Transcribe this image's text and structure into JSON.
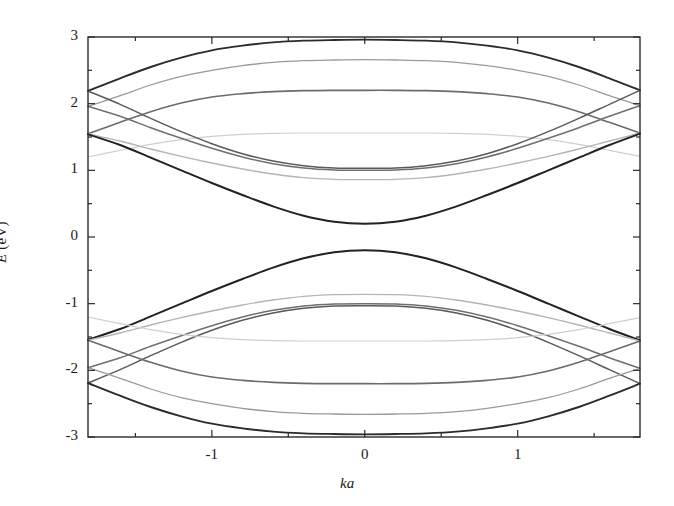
{
  "figure": {
    "kind": "band-structure-plot",
    "background": "#ffffff",
    "frame_color": "#2b2b2b"
  },
  "axes": {
    "xlabel": "ka",
    "ylabel_symbol": "E",
    "ylabel_unit": "(eV)",
    "ylabel_full": "E (eV)",
    "x_ticklabels": [
      "-1",
      "0",
      "1"
    ],
    "x_tickvalues": [
      -1,
      0,
      1
    ],
    "y_ticklabels": [
      "-3",
      "-2",
      "-1",
      "0",
      "1",
      "2",
      "3"
    ],
    "y_tickvalues": [
      -3,
      -2,
      -1,
      0,
      1,
      2,
      3
    ],
    "x_minor_step": 0.5,
    "y_minor_step": 0.5,
    "xlim": [
      -1.81,
      1.8
    ],
    "ylim": [
      -3,
      3
    ],
    "grid": false
  },
  "chart_data": {
    "type": "line",
    "title": "",
    "subtitle": "",
    "xlabel": "ka",
    "ylabel": "E (eV)",
    "xlim": [
      -1.81,
      1.8
    ],
    "ylim": [
      -3,
      3
    ],
    "xticks": [
      -1,
      0,
      1
    ],
    "yticks": [
      -3,
      -2,
      -1,
      0,
      1,
      2,
      3
    ],
    "x_minor_step": 0.5,
    "y_minor_step": 0.5,
    "grid": false,
    "legend": "none",
    "annotations": [],
    "x": [
      -1.81,
      -1.6,
      -1.4,
      -1.2,
      -1.0,
      -0.8,
      -0.6,
      -0.4,
      -0.2,
      0.0,
      0.2,
      0.4,
      0.6,
      0.8,
      1.0,
      1.2,
      1.4,
      1.6,
      1.8
    ],
    "series": [
      {
        "name": "c8",
        "shade": "#2b2b2b",
        "width": 1.9,
        "values": [
          2.19,
          2.38,
          2.55,
          2.69,
          2.8,
          2.87,
          2.92,
          2.945,
          2.955,
          2.96,
          2.955,
          2.945,
          2.92,
          2.87,
          2.8,
          2.69,
          2.55,
          2.38,
          2.2
        ]
      },
      {
        "name": "c7",
        "shade": "#9a9a9a",
        "width": 1.3,
        "values": [
          1.96,
          2.12,
          2.28,
          2.41,
          2.5,
          2.57,
          2.62,
          2.645,
          2.655,
          2.66,
          2.655,
          2.645,
          2.62,
          2.57,
          2.5,
          2.41,
          2.28,
          2.12,
          1.97
        ]
      },
      {
        "name": "c6",
        "shade": "#6b6b6b",
        "width": 1.6,
        "values": [
          1.55,
          1.72,
          1.88,
          2.01,
          2.1,
          2.15,
          2.18,
          2.195,
          2.2,
          2.2,
          2.2,
          2.195,
          2.18,
          2.15,
          2.1,
          2.01,
          1.88,
          1.72,
          1.56
        ]
      },
      {
        "name": "c5",
        "shade": "#cfcfcf",
        "width": 1.2,
        "values": [
          1.2,
          1.3,
          1.39,
          1.46,
          1.51,
          1.54,
          1.555,
          1.56,
          1.56,
          1.56,
          1.56,
          1.56,
          1.555,
          1.54,
          1.51,
          1.46,
          1.39,
          1.3,
          1.21
        ]
      },
      {
        "name": "c4",
        "shade": "#5a5a5a",
        "width": 1.5,
        "values": [
          2.19,
          1.99,
          1.78,
          1.58,
          1.4,
          1.25,
          1.14,
          1.07,
          1.035,
          1.03,
          1.035,
          1.07,
          1.14,
          1.25,
          1.4,
          1.58,
          1.78,
          1.99,
          2.2
        ]
      },
      {
        "name": "c3",
        "shade": "#6f6f6f",
        "width": 1.5,
        "values": [
          1.96,
          1.81,
          1.64,
          1.48,
          1.33,
          1.2,
          1.1,
          1.035,
          1.005,
          1.0,
          1.005,
          1.035,
          1.1,
          1.2,
          1.33,
          1.48,
          1.64,
          1.81,
          1.97
        ]
      },
      {
        "name": "c2",
        "shade": "#b4b4b4",
        "width": 1.3,
        "values": [
          1.55,
          1.44,
          1.32,
          1.21,
          1.11,
          1.02,
          0.945,
          0.89,
          0.865,
          0.86,
          0.865,
          0.89,
          0.945,
          1.02,
          1.11,
          1.21,
          1.32,
          1.44,
          1.56
        ]
      },
      {
        "name": "c1",
        "shade": "#222222",
        "width": 2.0,
        "values": [
          1.54,
          1.38,
          1.19,
          1.0,
          0.81,
          0.63,
          0.46,
          0.32,
          0.23,
          0.2,
          0.23,
          0.32,
          0.46,
          0.63,
          0.81,
          1.0,
          1.19,
          1.38,
          1.55
        ]
      },
      {
        "name": "v1",
        "shade": "#222222",
        "width": 2.0,
        "values": [
          -1.54,
          -1.38,
          -1.19,
          -1.0,
          -0.81,
          -0.63,
          -0.46,
          -0.32,
          -0.23,
          -0.2,
          -0.23,
          -0.32,
          -0.46,
          -0.63,
          -0.81,
          -1.0,
          -1.19,
          -1.38,
          -1.55
        ]
      },
      {
        "name": "v2",
        "shade": "#b4b4b4",
        "width": 1.3,
        "values": [
          -1.55,
          -1.44,
          -1.32,
          -1.21,
          -1.11,
          -1.02,
          -0.945,
          -0.89,
          -0.865,
          -0.86,
          -0.865,
          -0.89,
          -0.945,
          -1.02,
          -1.11,
          -1.21,
          -1.32,
          -1.44,
          -1.56
        ]
      },
      {
        "name": "v3",
        "shade": "#6f6f6f",
        "width": 1.5,
        "values": [
          -1.96,
          -1.81,
          -1.64,
          -1.48,
          -1.33,
          -1.2,
          -1.1,
          -1.035,
          -1.005,
          -1.0,
          -1.005,
          -1.035,
          -1.1,
          -1.2,
          -1.33,
          -1.48,
          -1.64,
          -1.81,
          -1.97
        ]
      },
      {
        "name": "v4",
        "shade": "#5a5a5a",
        "width": 1.5,
        "values": [
          -2.19,
          -1.99,
          -1.78,
          -1.58,
          -1.4,
          -1.25,
          -1.14,
          -1.07,
          -1.035,
          -1.03,
          -1.035,
          -1.07,
          -1.14,
          -1.25,
          -1.4,
          -1.58,
          -1.78,
          -1.99,
          -2.2
        ]
      },
      {
        "name": "v5",
        "shade": "#cfcfcf",
        "width": 1.2,
        "values": [
          -1.2,
          -1.3,
          -1.39,
          -1.46,
          -1.51,
          -1.54,
          -1.555,
          -1.56,
          -1.56,
          -1.56,
          -1.56,
          -1.56,
          -1.555,
          -1.54,
          -1.51,
          -1.46,
          -1.39,
          -1.3,
          -1.21
        ]
      },
      {
        "name": "v6",
        "shade": "#6b6b6b",
        "width": 1.6,
        "values": [
          -1.55,
          -1.72,
          -1.88,
          -2.01,
          -2.1,
          -2.15,
          -2.18,
          -2.195,
          -2.2,
          -2.2,
          -2.2,
          -2.195,
          -2.18,
          -2.15,
          -2.1,
          -2.01,
          -1.88,
          -1.72,
          -1.56
        ]
      },
      {
        "name": "v7",
        "shade": "#9a9a9a",
        "width": 1.3,
        "values": [
          -1.96,
          -2.12,
          -2.28,
          -2.41,
          -2.5,
          -2.57,
          -2.62,
          -2.645,
          -2.655,
          -2.66,
          -2.655,
          -2.645,
          -2.62,
          -2.57,
          -2.5,
          -2.41,
          -2.28,
          -2.12,
          -1.97
        ]
      },
      {
        "name": "v8",
        "shade": "#2b2b2b",
        "width": 1.9,
        "values": [
          -2.19,
          -2.38,
          -2.55,
          -2.69,
          -2.8,
          -2.87,
          -2.92,
          -2.945,
          -2.955,
          -2.96,
          -2.955,
          -2.945,
          -2.92,
          -2.87,
          -2.8,
          -2.69,
          -2.55,
          -2.38,
          -2.2
        ]
      }
    ]
  }
}
